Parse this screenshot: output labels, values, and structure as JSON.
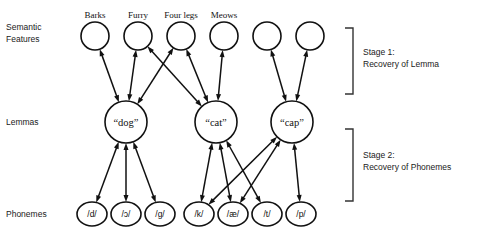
{
  "figure": {
    "background_color": "#ffffff",
    "line_color": "#111111",
    "text_color": "#1a1a1a"
  },
  "row_labels": {
    "semantic": "Semantic\nFeatures",
    "semantic_line1": "Semantic",
    "semantic_line2": "Features",
    "lemmas": "Lemmas",
    "phonemes": "Phonemes"
  },
  "stages": [
    {
      "id": "stage-1",
      "line1": "Stage 1:",
      "line2": "Recovery of Lemma",
      "bracket_top": 28,
      "bracket_bottom": 94
    },
    {
      "id": "stage-2",
      "line1": "Stage 2:",
      "line2": "Recovery of Phonemes",
      "bracket_top": 129,
      "bracket_bottom": 201
    }
  ],
  "semantic_features": [
    {
      "id": "sf-barks",
      "label": "Barks",
      "cx": 95,
      "cy": 36,
      "r": 14,
      "labeled": true
    },
    {
      "id": "sf-furry",
      "label": "Furry",
      "cx": 138,
      "cy": 36,
      "r": 14,
      "labeled": true
    },
    {
      "id": "sf-four-legs",
      "label": "Four legs",
      "cx": 181,
      "cy": 36,
      "r": 14,
      "labeled": true
    },
    {
      "id": "sf-meows",
      "label": "Meows",
      "cx": 224,
      "cy": 36,
      "r": 14,
      "labeled": true
    },
    {
      "id": "sf-blank-1",
      "label": "",
      "cx": 267,
      "cy": 36,
      "r": 14,
      "labeled": false
    },
    {
      "id": "sf-blank-2",
      "label": "",
      "cx": 310,
      "cy": 36,
      "r": 14,
      "labeled": false
    }
  ],
  "lemmas": [
    {
      "id": "lemma-dog",
      "label": "“dog”",
      "cx": 126,
      "cy": 122,
      "r": 21
    },
    {
      "id": "lemma-cat",
      "label": "“cat”",
      "cx": 216,
      "cy": 122,
      "r": 21
    },
    {
      "id": "lemma-cap",
      "label": "“cap”",
      "cx": 292,
      "cy": 122,
      "r": 21
    }
  ],
  "phonemes": [
    {
      "id": "ph-d",
      "label": "/d/",
      "cx": 92,
      "cy": 214,
      "rx": 15,
      "ry": 12
    },
    {
      "id": "ph-oh",
      "label": "/ɔ/",
      "cx": 126,
      "cy": 214,
      "rx": 15,
      "ry": 12
    },
    {
      "id": "ph-g",
      "label": "/g/",
      "cx": 160,
      "cy": 214,
      "rx": 15,
      "ry": 12
    },
    {
      "id": "ph-k",
      "label": "/k/",
      "cx": 199,
      "cy": 214,
      "rx": 15,
      "ry": 12
    },
    {
      "id": "ph-ae",
      "label": "/æ/",
      "cx": 233,
      "cy": 214,
      "rx": 15,
      "ry": 12
    },
    {
      "id": "ph-t",
      "label": "/t/",
      "cx": 267,
      "cy": 214,
      "rx": 15,
      "ry": 12
    },
    {
      "id": "ph-p",
      "label": "/p/",
      "cx": 301,
      "cy": 214,
      "rx": 15,
      "ry": 12
    }
  ],
  "connections_stage1": [
    {
      "from": "lemma-dog",
      "to": "sf-barks"
    },
    {
      "from": "lemma-dog",
      "to": "sf-furry"
    },
    {
      "from": "lemma-dog",
      "to": "sf-four-legs"
    },
    {
      "from": "lemma-cat",
      "to": "sf-furry"
    },
    {
      "from": "lemma-cat",
      "to": "sf-four-legs"
    },
    {
      "from": "lemma-cat",
      "to": "sf-meows"
    },
    {
      "from": "lemma-cap",
      "to": "sf-blank-1"
    },
    {
      "from": "lemma-cap",
      "to": "sf-blank-2"
    }
  ],
  "connections_stage2": [
    {
      "from": "lemma-dog",
      "to": "ph-d"
    },
    {
      "from": "lemma-dog",
      "to": "ph-oh"
    },
    {
      "from": "lemma-dog",
      "to": "ph-g"
    },
    {
      "from": "lemma-cat",
      "to": "ph-k"
    },
    {
      "from": "lemma-cat",
      "to": "ph-ae"
    },
    {
      "from": "lemma-cat",
      "to": "ph-t"
    },
    {
      "from": "lemma-cap",
      "to": "ph-k"
    },
    {
      "from": "lemma-cap",
      "to": "ph-ae"
    },
    {
      "from": "lemma-cap",
      "to": "ph-p"
    }
  ],
  "arrow_style": {
    "bidirectional": true,
    "head_length": 7,
    "head_width": 5
  }
}
